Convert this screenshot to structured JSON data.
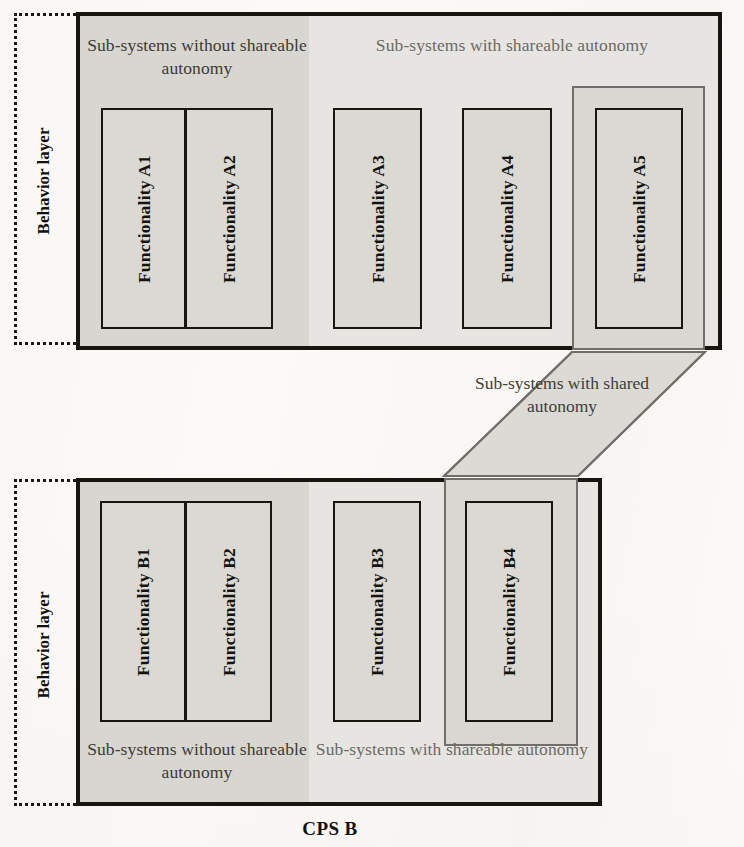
{
  "diagram": {
    "colors": {
      "border": "#17150f",
      "fill_dark": "#d8d6d0",
      "fill_light": "#e7e5e1",
      "connector_line": "#6f6e6a",
      "text": "#3c3a36"
    }
  },
  "cps_a": {
    "behavior_layer_label": "Behavior layer",
    "zone_without_label": "Sub-systems without shareable autonomy",
    "zone_with_label": "Sub-systems with shareable autonomy",
    "functionalities": [
      {
        "label": "Functionality A1",
        "group": "without"
      },
      {
        "label": "Functionality A2",
        "group": "without"
      },
      {
        "label": "Functionality A3",
        "group": "with"
      },
      {
        "label": "Functionality A4",
        "group": "with"
      },
      {
        "label": "Functionality A5",
        "group": "shared"
      }
    ]
  },
  "cps_b": {
    "title": "CPS B",
    "behavior_layer_label": "Behavior layer",
    "zone_without_label": "Sub-systems without shareable autonomy",
    "zone_with_label": "Sub-systems with shareable autonomy",
    "functionalities": [
      {
        "label": "Functionality B1",
        "group": "without"
      },
      {
        "label": "Functionality B2",
        "group": "without"
      },
      {
        "label": "Functionality B3",
        "group": "with"
      },
      {
        "label": "Functionality B4",
        "group": "shared"
      }
    ]
  },
  "connector": {
    "caption": "Sub-systems with shared autonomy"
  }
}
